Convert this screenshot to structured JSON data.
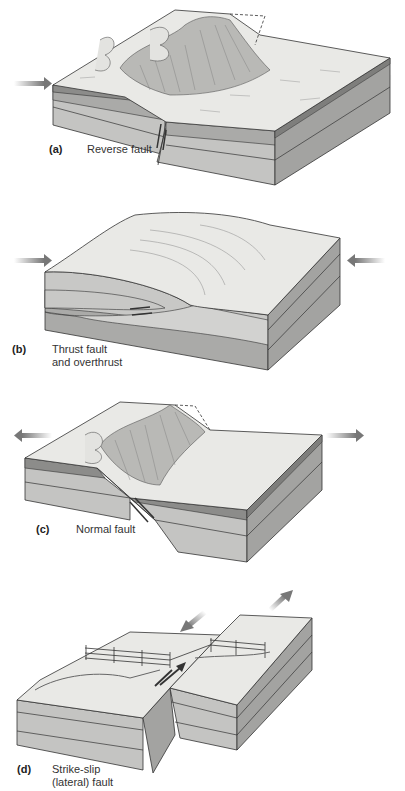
{
  "figure": {
    "panels": [
      {
        "letter": "(a)",
        "caption_lines": [
          "Reverse fault"
        ],
        "arrows": "compression"
      },
      {
        "letter": "(b)",
        "caption_lines": [
          "Thrust fault",
          "and overthrust"
        ],
        "arrows": "compression"
      },
      {
        "letter": "(c)",
        "caption_lines": [
          "Normal fault"
        ],
        "arrows": "tension"
      },
      {
        "letter": "(d)",
        "caption_lines": [
          "Strike-slip",
          "(lateral) fault"
        ],
        "arrows": "shear"
      }
    ]
  },
  "colors": {
    "surface": "#e9e9e6",
    "scarp": "#b9b9b6",
    "layer_dark": "#8c8c8a",
    "layer_mid": "#aaaaa8",
    "layer_light": "#c4c4c2",
    "side_dark": "#9a9a98",
    "arrow": "#7a7a7a",
    "outline": "#333333"
  }
}
